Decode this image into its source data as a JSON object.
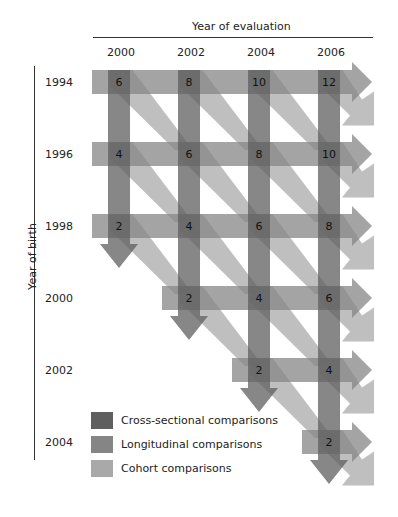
{
  "title_top": "Year of evaluation",
  "title_left": "Year of birth",
  "colors": {
    "cross_sectional": "#5f5f5f",
    "longitudinal": "#858585",
    "cohort": "#a9a9a9"
  },
  "columns": [
    "2000",
    "2002",
    "2004",
    "2006"
  ],
  "rows": [
    "1994",
    "1996",
    "1998",
    "2000",
    "2002",
    "2004"
  ],
  "legend": [
    {
      "key": "cross_sectional",
      "label": "Cross-sectional comparisons"
    },
    {
      "key": "longitudinal",
      "label": "Longitudinal comparisons"
    },
    {
      "key": "cohort",
      "label": "Cohort comparisons"
    }
  ],
  "chart_data": {
    "type": "table",
    "xlabel": "Year of evaluation",
    "ylabel": "Year of birth",
    "x": [
      "2000",
      "2002",
      "2004",
      "2006"
    ],
    "y": [
      "1994",
      "1996",
      "1998",
      "2000",
      "2002",
      "2004"
    ],
    "cells": [
      {
        "birth": "1994",
        "eval": "2000",
        "age": "6"
      },
      {
        "birth": "1994",
        "eval": "2002",
        "age": "8"
      },
      {
        "birth": "1994",
        "eval": "2004",
        "age": "10"
      },
      {
        "birth": "1994",
        "eval": "2006",
        "age": "12"
      },
      {
        "birth": "1996",
        "eval": "2000",
        "age": "4"
      },
      {
        "birth": "1996",
        "eval": "2002",
        "age": "6"
      },
      {
        "birth": "1996",
        "eval": "2004",
        "age": "8"
      },
      {
        "birth": "1996",
        "eval": "2006",
        "age": "10"
      },
      {
        "birth": "1998",
        "eval": "2000",
        "age": "2"
      },
      {
        "birth": "1998",
        "eval": "2002",
        "age": "4"
      },
      {
        "birth": "1998",
        "eval": "2004",
        "age": "6"
      },
      {
        "birth": "1998",
        "eval": "2006",
        "age": "8"
      },
      {
        "birth": "2000",
        "eval": "2002",
        "age": "2"
      },
      {
        "birth": "2000",
        "eval": "2004",
        "age": "4"
      },
      {
        "birth": "2000",
        "eval": "2006",
        "age": "6"
      },
      {
        "birth": "2002",
        "eval": "2004",
        "age": "2"
      },
      {
        "birth": "2002",
        "eval": "2006",
        "age": "4"
      },
      {
        "birth": "2004",
        "eval": "2006",
        "age": "2"
      }
    ],
    "legend": [
      "Cross-sectional comparisons",
      "Longitudinal comparisons",
      "Cohort comparisons"
    ],
    "legend_position": "bottom-left"
  }
}
